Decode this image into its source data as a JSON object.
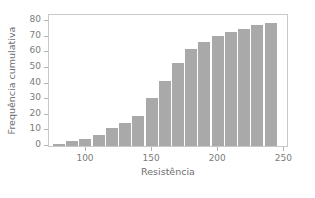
{
  "chart_data": {
    "type": "bar",
    "title": "",
    "subtitle": "",
    "xlabel": "Resistência",
    "ylabel": "Frequência cumulativa",
    "x": [
      80,
      90,
      100,
      110,
      120,
      130,
      140,
      150,
      160,
      170,
      180,
      190,
      200,
      210,
      220,
      230,
      240
    ],
    "values": [
      1,
      2,
      3,
      5,
      9,
      12,
      15,
      24,
      33,
      42,
      49,
      52,
      55,
      57,
      59,
      61,
      62
    ],
    "bin_width": 10,
    "bar_left_edges": [
      75,
      85,
      95,
      105,
      115,
      125,
      135,
      145,
      155,
      165,
      175,
      185,
      195,
      205,
      215,
      225,
      235
    ],
    "categories": [
      "75-85",
      "85-95",
      "95-105",
      "105-115",
      "115-125",
      "125-135",
      "135-145",
      "145-155",
      "155-165",
      "165-175",
      "175-185",
      "185-195",
      "195-205",
      "205-215",
      "215-225",
      "225-235",
      "235-245"
    ],
    "cumulative_values": [
      1.5,
      3,
      4.5,
      7,
      11.5,
      15,
      19.5,
      31,
      42,
      53.5,
      62.5,
      66.5,
      70.5,
      73,
      75,
      77.5,
      79
    ],
    "xlim": [
      72,
      252
    ],
    "ylim": [
      0,
      84
    ],
    "xticks": [
      100,
      150,
      200,
      250
    ],
    "xtick_labels": [
      "100",
      "150",
      "200",
      "250"
    ],
    "yticks": [
      0,
      10,
      20,
      30,
      40,
      50,
      60,
      70,
      80
    ],
    "ytick_labels": [
      "0",
      "10",
      "20",
      "30",
      "40",
      "50",
      "60",
      "70",
      "80"
    ],
    "grid": false,
    "legend": null,
    "bar_color": "#a9a9a9",
    "axis_color": "#c9c9c9",
    "tick_label_color": "#7b7b7b",
    "axis_label_color": "#6e6e6e",
    "background_color": "#ffffff"
  }
}
